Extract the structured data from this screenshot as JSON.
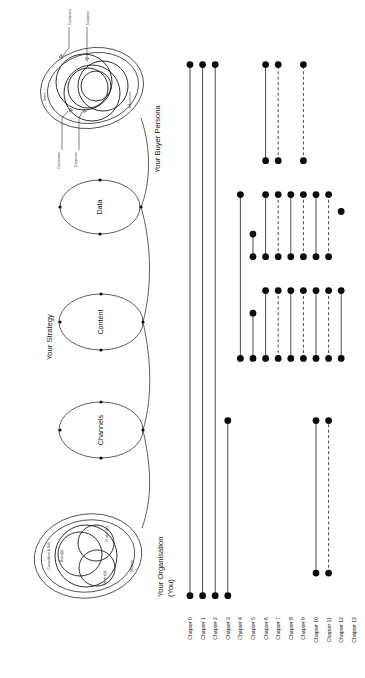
{
  "diagram": {
    "title_hidden": "",
    "sections": [
      {
        "id": "organisation",
        "label": "Your Organisation\n(You)",
        "label_line1": "Your Organisation",
        "label_line2": "(You)"
      },
      {
        "id": "strategy",
        "label": "Your Strategy"
      },
      {
        "id": "persona",
        "label": "Your Buyer Persona"
      }
    ],
    "organisation_rings": [
      {
        "name": "Competition & Self",
        "key": "competition-self"
      },
      {
        "name": "Brand(s)",
        "key": "brands"
      },
      {
        "name": "Product(s)",
        "key": "products"
      },
      {
        "name": "Service(s)",
        "key": "services"
      },
      {
        "name": "Markets",
        "key": "markets"
      }
    ],
    "strategy_nodes": [
      {
        "name": "Channels",
        "key": "channels"
      },
      {
        "name": "Content",
        "key": "content"
      },
      {
        "name": "Data",
        "key": "data"
      }
    ],
    "persona_rings": [
      {
        "name": "Users",
        "key": "users"
      },
      {
        "name": "Influencers",
        "key": "influencers"
      }
    ],
    "persona_arrows": [
      {
        "name": "Customers",
        "key": "customers-plural-top"
      },
      {
        "name": "Customer",
        "key": "customer-top"
      },
      {
        "name": "Consumers",
        "key": "consumers-plural-bottom"
      },
      {
        "name": "Consumer",
        "key": "consumer-bottom"
      }
    ]
  },
  "chart_data": {
    "type": "table",
    "title": "",
    "xlabel": "",
    "ylabel": "",
    "categories": [
      "Chapter 0",
      "Chapter 1",
      "Chapter 2",
      "Chapter 3",
      "Chapter 4",
      "Chapter 5",
      "Chapter 6",
      "Chapter 7",
      "Chapter 8",
      "Chapter 9",
      "Chapter 10",
      "Chapter 11",
      "Chapter 12",
      "Chapter 13"
    ],
    "legend": [],
    "series": [
      {
        "name": "Chapter 0",
        "style": "solid",
        "spans": [
          {
            "from": 0.02,
            "to": 0.96
          }
        ],
        "points": [
          0.02,
          0.96
        ]
      },
      {
        "name": "Chapter 1",
        "style": "solid",
        "spans": [
          {
            "from": 0.02,
            "to": 0.96
          }
        ],
        "points": [
          0.02,
          0.96
        ]
      },
      {
        "name": "Chapter 2",
        "style": "solid",
        "spans": [
          {
            "from": 0.02,
            "to": 0.96
          }
        ],
        "points": [
          0.02,
          0.96
        ]
      },
      {
        "name": "Chapter 3",
        "style": "solid",
        "spans": [
          {
            "from": 0.02,
            "to": 0.33
          }
        ],
        "points": [
          0.02,
          0.33
        ]
      },
      {
        "name": "Chapter 4",
        "style": "solid",
        "spans": [
          {
            "from": 0.44,
            "to": 0.73
          }
        ],
        "points": [
          0.44,
          0.73
        ]
      },
      {
        "name": "Chapter 5",
        "style": "solid",
        "spans": [
          {
            "from": 0.44,
            "to": 0.52
          },
          {
            "from": 0.62,
            "to": 0.66
          }
        ],
        "points": [
          0.44,
          0.52,
          0.62,
          0.66
        ]
      },
      {
        "name": "Chapter 6",
        "style": "solid",
        "spans": [
          {
            "from": 0.44,
            "to": 0.56
          },
          {
            "from": 0.62,
            "to": 0.73
          },
          {
            "from": 0.79,
            "to": 0.96
          }
        ],
        "points": [
          0.44,
          0.56,
          0.62,
          0.73,
          0.79,
          0.96
        ]
      },
      {
        "name": "Chapter 7",
        "style": "dashed",
        "spans": [
          {
            "from": 0.44,
            "to": 0.56
          },
          {
            "from": 0.62,
            "to": 0.73
          },
          {
            "from": 0.79,
            "to": 0.96
          }
        ],
        "points": [
          0.44,
          0.56,
          0.62,
          0.73,
          0.79,
          0.96
        ]
      },
      {
        "name": "Chapter 8",
        "style": "solid",
        "spans": [
          {
            "from": 0.44,
            "to": 0.56
          },
          {
            "from": 0.62,
            "to": 0.73
          }
        ],
        "points": [
          0.44,
          0.56,
          0.62,
          0.73
        ]
      },
      {
        "name": "Chapter 9",
        "style": "dashed",
        "spans": [
          {
            "from": 0.44,
            "to": 0.56
          },
          {
            "from": 0.62,
            "to": 0.73
          },
          {
            "from": 0.79,
            "to": 0.96
          }
        ],
        "points": [
          0.44,
          0.56,
          0.62,
          0.73,
          0.79,
          0.96
        ]
      },
      {
        "name": "Chapter 10",
        "style": "solid",
        "spans": [
          {
            "from": 0.06,
            "to": 0.33
          },
          {
            "from": 0.44,
            "to": 0.56
          },
          {
            "from": 0.62,
            "to": 0.73
          }
        ],
        "points": [
          0.06,
          0.33,
          0.44,
          0.56,
          0.62,
          0.73
        ]
      },
      {
        "name": "Chapter 11",
        "style": "dashed",
        "spans": [
          {
            "from": 0.06,
            "to": 0.33
          },
          {
            "from": 0.44,
            "to": 0.56
          },
          {
            "from": 0.62,
            "to": 0.73
          }
        ],
        "points": [
          0.06,
          0.33,
          0.44,
          0.56,
          0.62,
          0.73
        ]
      },
      {
        "name": "Chapter 12",
        "style": "solid",
        "spans": [
          {
            "from": 0.44,
            "to": 0.56
          }
        ],
        "points": [
          0.44,
          0.56,
          0.7
        ]
      },
      {
        "name": "Chapter 13",
        "style": "none",
        "spans": [],
        "points": []
      }
    ]
  }
}
